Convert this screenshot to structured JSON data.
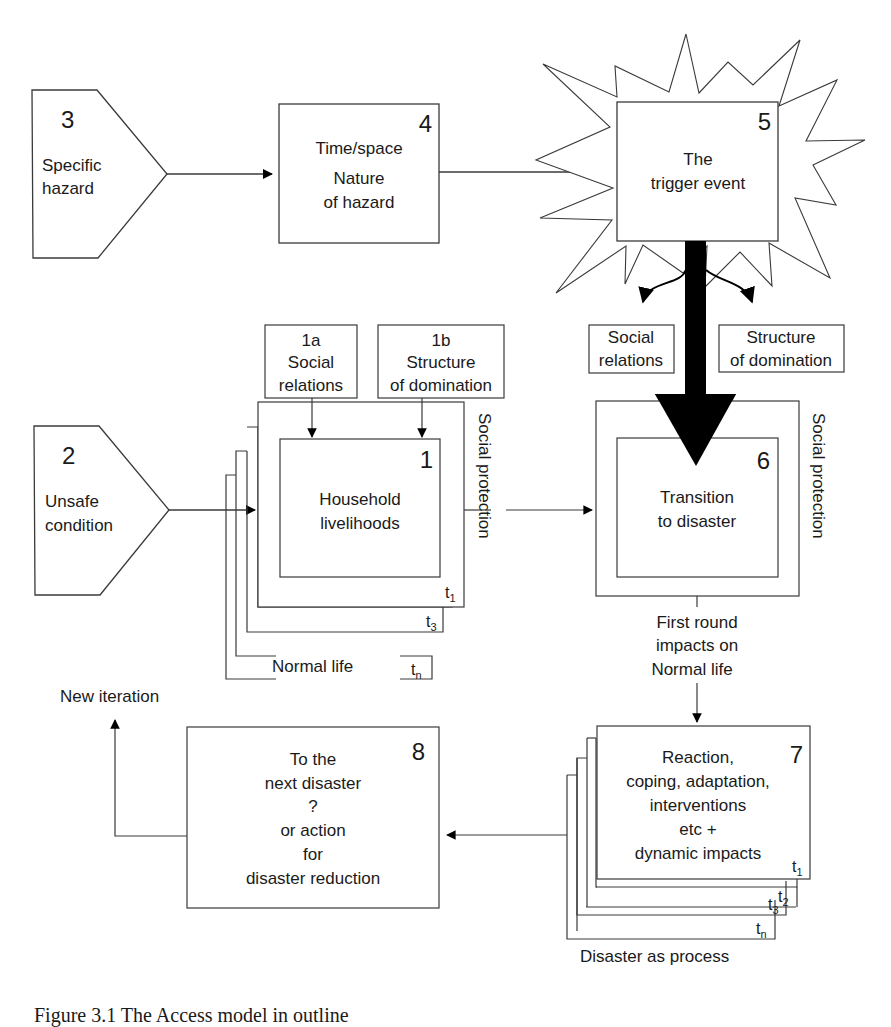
{
  "figure": {
    "caption": "Figure 3.1 The Access model in outline"
  },
  "nodes": {
    "n3": {
      "number": "3",
      "lines": [
        "Specific",
        "hazard"
      ]
    },
    "n4": {
      "number": "4",
      "lines": [
        "Time/space",
        "Nature",
        "of hazard"
      ]
    },
    "n5": {
      "number": "5",
      "lines": [
        "The",
        "trigger event"
      ]
    },
    "n2": {
      "number": "2",
      "lines": [
        "Unsafe",
        "condition"
      ]
    },
    "n1a": {
      "lines": [
        "1a",
        "Social",
        "relations"
      ]
    },
    "n1b": {
      "lines": [
        "1b",
        "Structure",
        "of domination"
      ]
    },
    "n1": {
      "number": "1",
      "lines": [
        "Household",
        "livelihoods"
      ]
    },
    "n1_side": "Social protection",
    "n1_stack": {
      "t1": "t",
      "t1_sub": "1",
      "t2": "t",
      "t2_sub": "2",
      "t3": "t",
      "t3_sub": "3",
      "tn": "t",
      "tn_sub": "n",
      "normal_life": "Normal life"
    },
    "social_rel": {
      "lines": [
        "Social",
        "relations"
      ]
    },
    "struct_dom": {
      "lines": [
        "Structure",
        "of domination"
      ]
    },
    "n6": {
      "number": "6",
      "lines": [
        "Transition",
        "to disaster"
      ]
    },
    "n6_side": "Social protection",
    "first_round": {
      "lines": [
        "First round",
        "impacts on",
        "Normal life"
      ]
    },
    "n7": {
      "number": "7",
      "lines": [
        "Reaction,",
        "coping, adaptation,",
        "interventions",
        "etc +",
        "dynamic impacts"
      ]
    },
    "n7_stack": {
      "t1": "t",
      "t1_sub": "1",
      "t2": "t",
      "t2_sub": "2",
      "t3": "t",
      "t3_sub": "3",
      "tn": "t",
      "tn_sub": "n",
      "process": "Disaster as process"
    },
    "n8": {
      "number": "8",
      "lines": [
        "To the",
        "next disaster",
        "?",
        "or action",
        "for",
        "disaster reduction"
      ]
    },
    "new_iteration": "New iteration"
  },
  "colors": {
    "stroke": "#3a3a3a",
    "ink": "#1a1a1a",
    "background": "#ffffff",
    "arrow_fill": "#000000"
  }
}
